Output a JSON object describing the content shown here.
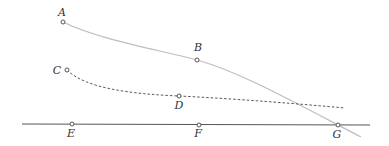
{
  "diagram": {
    "points": [
      {
        "id": "A",
        "label": "A",
        "x": 63,
        "y": 22,
        "lx": 62,
        "ly": 16
      },
      {
        "id": "B",
        "label": "B",
        "x": 197,
        "y": 60,
        "lx": 198,
        "ly": 51
      },
      {
        "id": "C",
        "label": "C",
        "x": 67,
        "y": 70,
        "lx": 57,
        "ly": 74
      },
      {
        "id": "D",
        "label": "D",
        "x": 179,
        "y": 96,
        "lx": 179,
        "ly": 109
      },
      {
        "id": "E",
        "label": "E",
        "x": 72,
        "y": 124,
        "lx": 71,
        "ly": 137
      },
      {
        "id": "F",
        "label": "F",
        "x": 199,
        "y": 125,
        "lx": 198,
        "ly": 137
      },
      {
        "id": "G",
        "label": "G",
        "x": 338,
        "y": 125,
        "lx": 337,
        "ly": 138
      }
    ],
    "colors": {
      "curve_ab": "#bdbdbd",
      "dashed": "#444444",
      "baseline": "#555555",
      "point_stroke": "#444444"
    }
  }
}
